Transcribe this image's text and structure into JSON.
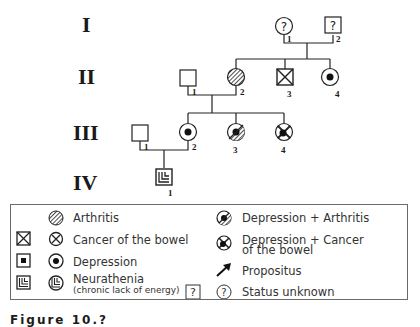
{
  "generations": [
    "I",
    "II",
    "III",
    "IV"
  ],
  "pedigree": {
    "I": [
      {
        "id": "I-1",
        "number": "1",
        "sex": "female",
        "status": "Status unknown",
        "mark": "?"
      },
      {
        "id": "I-2",
        "number": "2",
        "sex": "male",
        "status": "Status unknown",
        "mark": "?"
      }
    ],
    "II": [
      {
        "id": "II-1",
        "number": "1",
        "sex": "male",
        "status": "Unaffected"
      },
      {
        "id": "II-2",
        "number": "2",
        "sex": "female",
        "status": "Arthritis"
      },
      {
        "id": "II-3",
        "number": "3",
        "sex": "male",
        "status": "Cancer of the bowel"
      },
      {
        "id": "II-4",
        "number": "4",
        "sex": "female",
        "status": "Depression"
      }
    ],
    "III": [
      {
        "id": "III-1",
        "number": "1",
        "sex": "male",
        "status": "Unaffected"
      },
      {
        "id": "III-2",
        "number": "2",
        "sex": "female",
        "status": "Depression"
      },
      {
        "id": "III-3",
        "number": "3",
        "sex": "female",
        "status": "Depression + Arthritis"
      },
      {
        "id": "III-4",
        "number": "4",
        "sex": "female",
        "status": "Depression + Cancer of the bowel"
      }
    ],
    "IV": [
      {
        "id": "IV-1",
        "number": "1",
        "sex": "male",
        "status": "Neurathenia"
      }
    ]
  },
  "legend": {
    "items": [
      {
        "label": "Arthritis",
        "symbols": [
          "circle-hatched"
        ]
      },
      {
        "label": "Cancer of the bowel",
        "symbols": [
          "square-cross",
          "circle-cross"
        ]
      },
      {
        "label": "Depression",
        "symbols": [
          "square-dot",
          "circle-dot"
        ]
      },
      {
        "label": "Neurathenia",
        "sublabel": "(chronic lack of energy)",
        "symbols": [
          "square-nested",
          "circle-nested"
        ]
      },
      {
        "label": "Depression + Arthritis",
        "symbols": [
          "circle-dot-hatched"
        ]
      },
      {
        "label": "Depression + Cancer",
        "label2": "of the bowel",
        "symbols": [
          "circle-dot-cross"
        ]
      },
      {
        "label": "Propositus",
        "symbols": [
          "arrow"
        ]
      },
      {
        "label": "Status unknown",
        "symbols": [
          "square-question",
          "circle-question"
        ]
      }
    ]
  },
  "caption": "Figure 10.?"
}
